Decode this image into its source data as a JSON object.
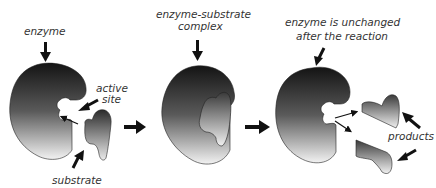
{
  "diagram": {
    "stages": [
      {
        "id": "stage-1",
        "label": "enzyme"
      },
      {
        "id": "stage-2",
        "label_line1": "enzyme-substrate",
        "label_line2": "complex"
      },
      {
        "id": "stage-3",
        "label_line1": "enzyme is unchanged",
        "label_line2": "after the reaction"
      }
    ],
    "labels": {
      "enzyme": "enzyme",
      "active_site_line1": "active",
      "active_site_line2": "site",
      "substrate": "substrate",
      "complex_line1": "enzyme-substrate",
      "complex_line2": "complex",
      "unchanged_line1": "enzyme is unchanged",
      "unchanged_line2": "after the reaction",
      "products": "products"
    },
    "colors": {
      "shape_dark": "#1a1a1a",
      "shape_light": "#f4f4f4",
      "arrow": "#111111",
      "text": "#333333"
    }
  }
}
